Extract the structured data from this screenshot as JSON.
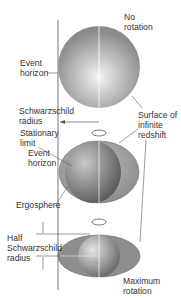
{
  "diagram": {
    "labels": {
      "no_rotation": [
        "No",
        "rotation"
      ],
      "event_horizon_top": [
        "Event",
        "horizon"
      ],
      "schwarzschild_radius": [
        "Schwarzschild",
        "radius"
      ],
      "surface_infinite_redshift": [
        "Surface of",
        "infinite",
        "redshift"
      ],
      "stationary_limit": [
        "Stationary",
        "limit"
      ],
      "event_horizon_mid": [
        "Event",
        "horizon"
      ],
      "ergosphere": "Ergosphere",
      "half_schwarzschild_radius": [
        "Half",
        "Schwarzschild",
        "radius"
      ],
      "maximum_rotation": [
        "Maximum",
        "rotation"
      ]
    },
    "colors": {
      "sphere_light": "#f2f2f2",
      "sphere_dark": "#8a8a8a",
      "ergosphere_fill": "#d4d4d4",
      "line": "#555555"
    }
  }
}
